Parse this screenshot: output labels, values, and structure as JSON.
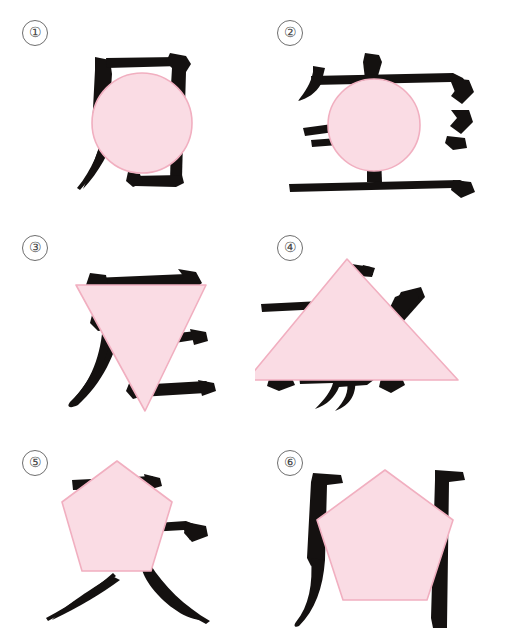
{
  "page": {
    "background_color": "#ffffff",
    "width": 509,
    "height": 644,
    "columns": 2,
    "rows": 3
  },
  "style": {
    "shape_fill": "#FADCE4",
    "shape_stroke": "#F1AFC0",
    "glyph_color": "#141110",
    "label_text_color": "#4a4a4a",
    "label_border_color": "#6e6e6e"
  },
  "panels": [
    {
      "label": "①",
      "number": 1,
      "shape": "circle",
      "shape_name": "pink-circle",
      "character": "尼",
      "character_name": "cjk-character-1"
    },
    {
      "label": "②",
      "number": 2,
      "shape": "circle",
      "shape_name": "pink-circle",
      "character": "室",
      "character_name": "cjk-character-2"
    },
    {
      "label": "③",
      "number": 3,
      "shape": "inverted-triangle",
      "shape_name": "pink-inverted-triangle",
      "character": "定",
      "character_name": "cjk-character-3"
    },
    {
      "label": "④",
      "number": 4,
      "shape": "triangle",
      "shape_name": "pink-triangle",
      "character": "季",
      "character_name": "cjk-character-4"
    },
    {
      "label": "⑤",
      "number": 5,
      "shape": "pentagon",
      "shape_name": "pink-pentagon",
      "character": "大",
      "character_name": "cjk-character-5"
    },
    {
      "label": "⑥",
      "number": 6,
      "shape": "pentagon",
      "shape_name": "pink-pentagon",
      "character": "肉",
      "character_name": "cjk-character-6"
    }
  ]
}
